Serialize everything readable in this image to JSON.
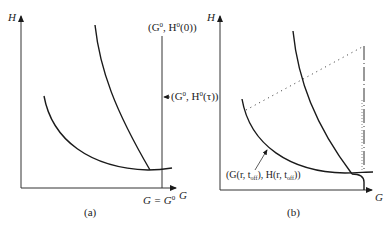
{
  "panels": [
    {
      "id": "a",
      "caption": "(a)",
      "y_axis_label": "H",
      "x_axis_label": "G",
      "x_marker_label": "G = G",
      "x_marker_sup": "0",
      "top_label_open": "(G",
      "top_label_sup1": "0",
      "top_label_mid": ", H",
      "top_label_sup2": "0",
      "top_label_close": "(0))",
      "side_label_open": "(G",
      "side_label_sup1": "0",
      "side_label_mid": ", H",
      "side_label_sup2": "0",
      "side_label_close": "(τ))"
    },
    {
      "id": "b",
      "caption": "(b)",
      "y_axis_label": "H",
      "x_axis_label": "G",
      "curve_label_open": "(G(r, t",
      "curve_label_sub1": "off",
      "curve_label_mid": "), H(r, t",
      "curve_label_sub2": "off",
      "curve_label_close": "))"
    }
  ],
  "colors": {
    "line": "#1a1a1a",
    "background": "#ffffff"
  }
}
